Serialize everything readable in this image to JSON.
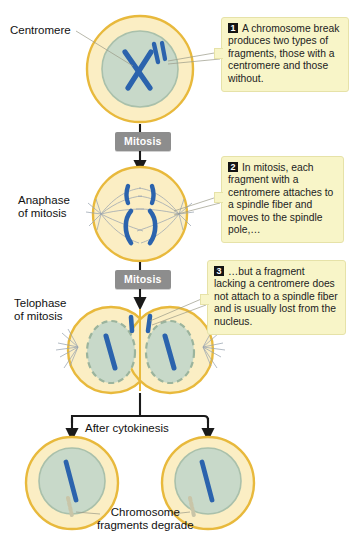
{
  "figure": {
    "colors": {
      "cytoplasm": "#fbeec4",
      "cell_rim": "#e8b93c",
      "nucleus": "#c8d9c9",
      "nucleus_rim": "#a9c0ab",
      "chromosome": "#2b63ad",
      "callout_bg": "#f8f5c8",
      "callout_border": "#e6e2a8",
      "pill_bg": "#8d8d8d",
      "arrow": "#1a1a1a",
      "spindle": "#8f9aa8"
    }
  },
  "labels": {
    "centromere": "Centromere",
    "anaphase": "Anaphase\nof mitosis",
    "telophase": "Telophase\nof mitosis",
    "after_cytokinesis": "After cytokinesis",
    "fragments_degrade": "Chromosome\nfragments degrade"
  },
  "steps": {
    "mitosis_1": "Mitosis",
    "mitosis_2": "Mitosis"
  },
  "callouts": [
    {
      "number": "1",
      "text": "A chromosome break produces two types of fragments, those with a centromere and those without."
    },
    {
      "number": "2",
      "text": "In mitosis, each fragment with a centromere attaches to a spindle fiber and moves to the spindle pole,…"
    },
    {
      "number": "3",
      "text": "…but a fragment lacking a centromere does not attach to a spindle fiber and is usually lost from the nucleus."
    }
  ]
}
